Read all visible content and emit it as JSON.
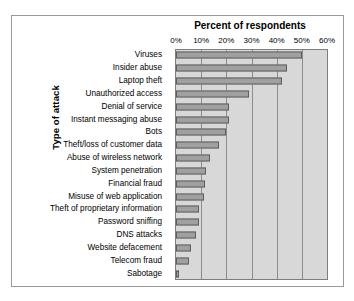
{
  "chart_data": {
    "type": "bar",
    "orientation": "horizontal",
    "title": "Percent of respondents",
    "xlabel": "Percent of respondents",
    "ylabel": "Type of attack",
    "xlim": [
      0,
      60
    ],
    "xtick_labels": [
      "0%",
      "10%",
      "20%",
      "30%",
      "40%",
      "50%",
      "60%"
    ],
    "xtick_values": [
      0,
      10,
      20,
      30,
      40,
      50,
      60
    ],
    "grid": "vertical",
    "legend": null,
    "categories": [
      "Viruses",
      "Insider abuse",
      "Laptop theft",
      "Unauthorized access",
      "Denial of service",
      "Instant messaging abuse",
      "Bots",
      "Theft/loss of customer data",
      "Abuse of wireless network",
      "System penetration",
      "Financial fraud",
      "Misuse of web application",
      "Theft of proprietary information",
      "Password sniffing",
      "DNS attacks",
      "Website defacement",
      "Telecom fraud",
      "Sabotage"
    ],
    "values": [
      50,
      44,
      42,
      29,
      21,
      21,
      20,
      17,
      13.5,
      12,
      11.5,
      11,
      9.2,
      9,
      8,
      6,
      5.2,
      1.3
    ],
    "bar_fill_color": "#a0a0a0",
    "bar_edge_color": "#5e5e5e",
    "plot_background_color": "#d8d8d8",
    "gridline_color": "#8c8c8c"
  },
  "chart": {
    "title": "Percent of respondents",
    "y_axis_title": "Type of attack"
  }
}
